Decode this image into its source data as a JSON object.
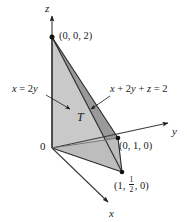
{
  "figure": {
    "type": "3d-coordinate-diagram",
    "background_color": "#ffffff",
    "line_color": "#1a1a1a",
    "face_light_color": "#c9c9c9",
    "face_dark_color": "#9a9a9a"
  },
  "axes": {
    "z": {
      "label": "z",
      "direction": "up",
      "arrow_tip": [
        52,
        11
      ]
    },
    "y": {
      "label": "y",
      "direction": "up-right",
      "arrow_tip": [
        172,
        121
      ]
    },
    "x": {
      "label": "x",
      "direction": "down-right",
      "arrow_tip": [
        111,
        206
      ]
    },
    "origin": {
      "label": "0",
      "position": [
        52,
        148
      ]
    }
  },
  "points": [
    {
      "name": "apex",
      "label": "(0, 0, 2)",
      "coords": [
        0,
        0,
        2
      ],
      "pixel": [
        52,
        37
      ]
    },
    {
      "name": "y-intercept",
      "label": "(0, 1, 0)",
      "coords": [
        0,
        1,
        0
      ],
      "pixel": [
        118,
        138
      ]
    },
    {
      "name": "base-corner",
      "label_parts": {
        "open": "(",
        "first": "1",
        "comma1": ", ",
        "frac_num": "1",
        "frac_den": "2",
        "comma2": ", ",
        "last": "0",
        "close": ")"
      },
      "label": "(1, 1/2, 0)",
      "coords": [
        1,
        0.5,
        0
      ],
      "pixel": [
        122,
        172
      ]
    }
  ],
  "annotations": [
    {
      "name": "plane-x-equals-2y",
      "text_parts": {
        "var1": "x",
        "rel": " = 2",
        "var2": "y"
      },
      "text": "x = 2y",
      "label_pixel": [
        14,
        89
      ],
      "leader_from": [
        48,
        96
      ],
      "leader_to": [
        72,
        110
      ]
    },
    {
      "name": "plane-x-plus-2y-plus-z",
      "text_parts": {
        "v1": "x",
        "op1": " + 2",
        "v2": "y",
        "op2": " + ",
        "v3": "z",
        "op3": " = 2"
      },
      "text": "x + 2y + z = 2",
      "label_pixel": [
        110,
        90
      ],
      "leader_from": [
        108,
        97
      ],
      "leader_to": [
        89,
        110
      ]
    }
  ],
  "region": {
    "name": "solid-region-T",
    "label": "T",
    "label_pixel": [
      79,
      118
    ]
  }
}
